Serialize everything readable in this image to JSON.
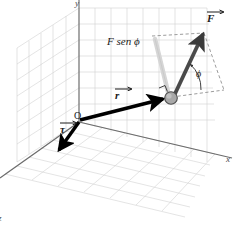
{
  "figure": {
    "background_color": "#ffffff"
  },
  "axes": {
    "x_label": "x",
    "y_label": "y",
    "z_label": "z",
    "axis_color": "#555555",
    "grid_color": "#cfcfcf"
  },
  "labels": {
    "origin": "O",
    "force_vector": "F",
    "position_vector": "r",
    "torque_vector": "τ",
    "force_component": "F sen ϕ",
    "angle": "ϕ"
  },
  "vectors": [
    {
      "name": "position-vector",
      "symbol": "r",
      "color": "#000000",
      "description": "Black arrow from origin O to the ball"
    },
    {
      "name": "force-vector",
      "symbol": "F",
      "color": "#3a3a3a",
      "description": "Dark gray arrow from the ball pointing up and to the right"
    },
    {
      "name": "torque-vector",
      "symbol": "τ",
      "color": "#000000",
      "description": "Black arrow from origin O pointing down-left along the z axis"
    },
    {
      "name": "force-component",
      "symbol": "F sen ϕ",
      "color": "#d0d0d0",
      "description": "Light gray vertical segment from the ball up to the force tip height"
    }
  ],
  "markers": {
    "ball_color": "#9a9a9a",
    "ball_outline": "#4a4a4a",
    "right_angle_marker": true,
    "dashed_line_color": "#7a7a7a"
  }
}
